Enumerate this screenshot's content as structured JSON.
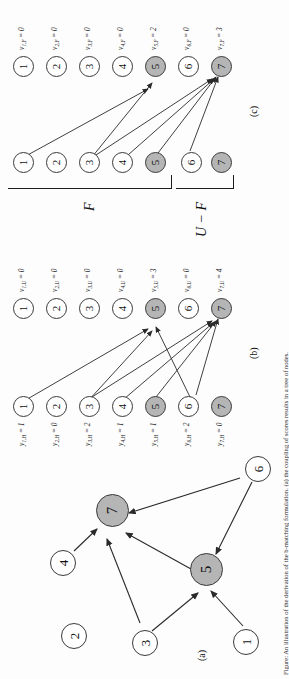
{
  "figure": {
    "caption": "Figure: An illustration of the derivation of the b-matching formulation. (a) the coupling of scores results in a tree of nodes.",
    "panels": [
      {
        "id": "a",
        "sublabel": "(a)"
      },
      {
        "id": "b",
        "sublabel": "(b)"
      },
      {
        "id": "c",
        "sublabel": "(c)"
      }
    ]
  },
  "panel_a": {
    "sublabel": "(a)",
    "nodes": [
      {
        "id": "1",
        "label": "1",
        "shaded": false
      },
      {
        "id": "2",
        "label": "2",
        "shaded": false
      },
      {
        "id": "3",
        "label": "3",
        "shaded": false
      },
      {
        "id": "4",
        "label": "4",
        "shaded": false
      },
      {
        "id": "5",
        "label": "5",
        "shaded": true
      },
      {
        "id": "6",
        "label": "6",
        "shaded": false
      },
      {
        "id": "7",
        "label": "7",
        "shaded": true
      }
    ],
    "edges": [
      {
        "from": "1",
        "to": "5"
      },
      {
        "from": "3",
        "to": "5"
      },
      {
        "from": "3",
        "to": "7"
      },
      {
        "from": "4",
        "to": "7"
      },
      {
        "from": "5",
        "to": "7"
      },
      {
        "from": "6",
        "to": "5"
      },
      {
        "from": "6",
        "to": "7"
      }
    ]
  },
  "panel_b": {
    "sublabel": "(b)",
    "left_column_label_prefix": "y",
    "left_column_subscript": "H",
    "right_column_label_prefix": "v",
    "right_column_subscript": "U",
    "left_nodes": [
      {
        "label": "1",
        "shaded": false,
        "value_text": "y",
        "sub": "1,H",
        "value": "1"
      },
      {
        "label": "2",
        "shaded": false,
        "value_text": "y",
        "sub": "2,H",
        "value": "0"
      },
      {
        "label": "3",
        "shaded": false,
        "value_text": "y",
        "sub": "3,H",
        "value": "2"
      },
      {
        "label": "4",
        "shaded": false,
        "value_text": "y",
        "sub": "4,H",
        "value": "1"
      },
      {
        "label": "5",
        "shaded": true,
        "value_text": "y",
        "sub": "5,H",
        "value": "1"
      },
      {
        "label": "6",
        "shaded": false,
        "value_text": "y",
        "sub": "6,H",
        "value": "2"
      },
      {
        "label": "7",
        "shaded": true,
        "value_text": "y",
        "sub": "7,H",
        "value": "0"
      }
    ],
    "right_nodes": [
      {
        "label": "1",
        "shaded": false,
        "value_text": "v",
        "sub": "1,U",
        "value": "0"
      },
      {
        "label": "2",
        "shaded": false,
        "value_text": "v",
        "sub": "2,U",
        "value": "0"
      },
      {
        "label": "3",
        "shaded": false,
        "value_text": "v",
        "sub": "3,U",
        "value": "0"
      },
      {
        "label": "4",
        "shaded": false,
        "value_text": "v",
        "sub": "4,U",
        "value": "0"
      },
      {
        "label": "5",
        "shaded": true,
        "value_text": "v",
        "sub": "5,U",
        "value": "3"
      },
      {
        "label": "6",
        "shaded": false,
        "value_text": "v",
        "sub": "6,U",
        "value": "0"
      },
      {
        "label": "7",
        "shaded": true,
        "value_text": "v",
        "sub": "7,U",
        "value": "4"
      }
    ],
    "edges": [
      {
        "from": "1",
        "to": "5"
      },
      {
        "from": "3",
        "to": "5"
      },
      {
        "from": "3",
        "to": "7"
      },
      {
        "from": "4",
        "to": "7"
      },
      {
        "from": "5",
        "to": "7"
      },
      {
        "from": "6",
        "to": "5"
      },
      {
        "from": "6",
        "to": "7"
      }
    ]
  },
  "panel_c": {
    "sublabel": "(c)",
    "bracket_labels": {
      "top": "F",
      "bottom": "U − F"
    },
    "left_nodes": [
      {
        "label": "1",
        "shaded": false,
        "group": "F"
      },
      {
        "label": "2",
        "shaded": false,
        "group": "F"
      },
      {
        "label": "3",
        "shaded": false,
        "group": "F"
      },
      {
        "label": "4",
        "shaded": false,
        "group": "F"
      },
      {
        "label": "5",
        "shaded": true,
        "group": "F"
      },
      {
        "label": "6",
        "shaded": false,
        "group": "U-F"
      },
      {
        "label": "7",
        "shaded": true,
        "group": "U-F"
      }
    ],
    "right_nodes": [
      {
        "label": "1",
        "shaded": false,
        "value_text": "v",
        "sub": "1,F",
        "value": "0"
      },
      {
        "label": "2",
        "shaded": false,
        "value_text": "v",
        "sub": "2,F",
        "value": "0"
      },
      {
        "label": "3",
        "shaded": false,
        "value_text": "v",
        "sub": "3,F",
        "value": "0"
      },
      {
        "label": "4",
        "shaded": false,
        "value_text": "v",
        "sub": "4,F",
        "value": "0"
      },
      {
        "label": "5",
        "shaded": true,
        "value_text": "v",
        "sub": "5,F",
        "value": "2"
      },
      {
        "label": "6",
        "shaded": false,
        "value_text": "v",
        "sub": "6,F",
        "value": "0"
      },
      {
        "label": "7",
        "shaded": true,
        "value_text": "v",
        "sub": "7,F",
        "value": "3"
      }
    ],
    "edges": [
      {
        "from": "1",
        "to": "5"
      },
      {
        "from": "3",
        "to": "5"
      },
      {
        "from": "3",
        "to": "7"
      },
      {
        "from": "4",
        "to": "7"
      },
      {
        "from": "5",
        "to": "7"
      },
      {
        "from": "6",
        "to": "7"
      }
    ]
  },
  "colors": {
    "shaded_node": "#b5b5b5",
    "node_border": "#3a3a3a",
    "edge": "#2a2a2a",
    "text": "#111111"
  }
}
